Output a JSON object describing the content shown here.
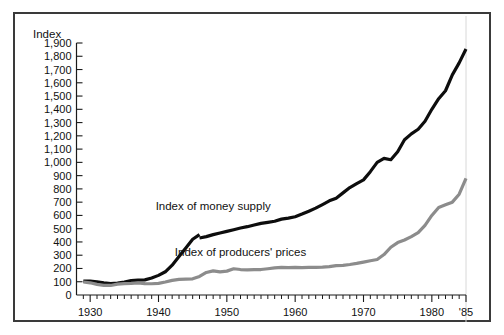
{
  "chart_data": {
    "type": "line",
    "title": "",
    "xlabel": "",
    "ylabel": "Index",
    "ylim": [
      0,
      1900
    ],
    "xlim": [
      1928,
      1985
    ],
    "grid": false,
    "legend_position": "inline-annotation",
    "y_ticks": [
      0,
      100,
      200,
      300,
      400,
      500,
      600,
      700,
      800,
      900,
      1000,
      1100,
      1200,
      1300,
      1400,
      1500,
      1600,
      1700,
      1800,
      1900
    ],
    "y_tick_labels": [
      "0",
      "100",
      "200",
      "300",
      "400",
      "500",
      "600",
      "700",
      "800",
      "900",
      "1,000",
      "1,100",
      "1,200",
      "1,300",
      "1,400",
      "1,500",
      "1,600",
      "1,700",
      "1,800",
      "1,900"
    ],
    "x_ticks": [
      1930,
      1940,
      1950,
      1960,
      1970,
      1980,
      1985
    ],
    "x_tick_labels": [
      "1930",
      "1940",
      "1950",
      "1960",
      "1970",
      "1980",
      "'85"
    ],
    "x_minor_tick_interval": 1,
    "series": [
      {
        "name": "Index of money supply",
        "color": "#0d0d0d",
        "label_x": 1948,
        "label_y": 640,
        "has_break": true,
        "break_after_x": 1946,
        "x": [
          1929,
          1930,
          1931,
          1932,
          1933,
          1934,
          1935,
          1936,
          1937,
          1938,
          1939,
          1940,
          1941,
          1942,
          1943,
          1944,
          1945,
          1946
        ],
        "values": [
          105,
          104,
          100,
          92,
          86,
          90,
          98,
          108,
          112,
          114,
          128,
          148,
          175,
          225,
          290,
          355,
          420,
          455
        ],
        "x2": [
          1946,
          1947,
          1948,
          1949,
          1950,
          1951,
          1952,
          1953,
          1954,
          1955,
          1956,
          1957,
          1958,
          1959,
          1960,
          1961,
          1962,
          1963,
          1964,
          1965,
          1966,
          1967,
          1968,
          1969,
          1970,
          1971,
          1972,
          1973,
          1974,
          1975,
          1976,
          1977,
          1978,
          1979,
          1980,
          1981,
          1982,
          1983,
          1984,
          1985
        ],
        "values2": [
          430,
          440,
          455,
          468,
          480,
          492,
          505,
          515,
          528,
          540,
          548,
          556,
          572,
          580,
          590,
          610,
          632,
          655,
          682,
          710,
          730,
          770,
          810,
          840,
          868,
          930,
          1000,
          1030,
          1020,
          1080,
          1170,
          1215,
          1250,
          1310,
          1400,
          1480,
          1540,
          1660,
          1750,
          1855
        ]
      },
      {
        "name": "Index of producers' prices",
        "color": "#8c8c8c",
        "label_x": 1952,
        "label_y": 295,
        "has_break": false,
        "x": [
          1929,
          1930,
          1931,
          1932,
          1933,
          1934,
          1935,
          1936,
          1937,
          1938,
          1939,
          1940,
          1941,
          1942,
          1943,
          1944,
          1945,
          1946,
          1947,
          1948,
          1949,
          1950,
          1951,
          1952,
          1953,
          1954,
          1955,
          1956,
          1957,
          1958,
          1959,
          1960,
          1961,
          1962,
          1963,
          1964,
          1965,
          1966,
          1967,
          1968,
          1969,
          1970,
          1971,
          1972,
          1973,
          1974,
          1975,
          1976,
          1977,
          1978,
          1979,
          1980,
          1981,
          1982,
          1983,
          1984,
          1985
        ],
        "values": [
          98,
          92,
          80,
          72,
          72,
          82,
          86,
          88,
          92,
          86,
          85,
          88,
          98,
          110,
          118,
          120,
          122,
          140,
          170,
          182,
          174,
          180,
          198,
          192,
          190,
          192,
          192,
          198,
          205,
          208,
          206,
          208,
          207,
          208,
          208,
          210,
          214,
          222,
          224,
          230,
          238,
          248,
          258,
          268,
          305,
          360,
          395,
          415,
          440,
          470,
          525,
          600,
          660,
          680,
          700,
          760,
          880
        ]
      }
    ],
    "annotations": [
      {
        "text": "Index of money supply",
        "x": 1948,
        "y": 640
      },
      {
        "text": "Index of producers' prices",
        "x": 1952,
        "y": 295
      }
    ]
  },
  "axis": {
    "y_axis_title": "Index"
  }
}
